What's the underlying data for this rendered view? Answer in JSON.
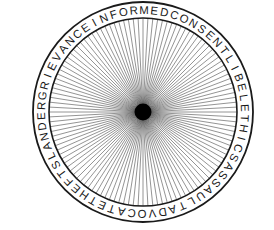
{
  "figure": {
    "name": "wheel-of-concepts-diagram",
    "ring_text": "INFORMEDCONSENTLIBELETHICSASSAULTADVOCATETHEFTSLANDERGRIEVANCE",
    "terms": [
      "INFORMED CONSENT",
      "LIBEL",
      "ETHICS",
      "ASSAULT",
      "ADVOCATE",
      "THEFT",
      "SLANDER",
      "GRIEVANCE"
    ],
    "spoke_count": 120,
    "hub_label": "hub",
    "colors": {
      "ink": "#1a1a1a",
      "spoke": "#3a3a3a",
      "hub": "#000000",
      "background": "#ffffff",
      "credit": "#8d8d8d"
    },
    "geometry": {
      "center_x": 143,
      "center_y": 112,
      "outer_radius": 110,
      "inner_radius": 94,
      "hub_radius": 8.5,
      "rim_text_radius": 102,
      "start_angle_deg": -118.5
    }
  },
  "credit": {
    "text": "© Cengage Learning 2014"
  }
}
